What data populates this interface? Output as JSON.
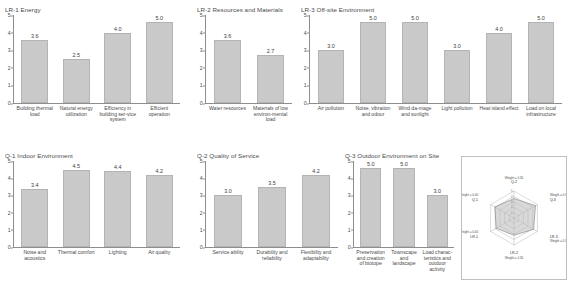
{
  "figure": {
    "panels": [
      {
        "id": "lr1",
        "title": "LR-1 Energy",
        "categories": [
          "Building thermal load",
          "Natural energy utilization",
          "Efficiency in building ser-vice system",
          "Efficient operation"
        ],
        "values": [
          3.6,
          2.5,
          4.0,
          5.0
        ],
        "value_labels": [
          "3.6",
          "2.5",
          "4.0",
          "5.0"
        ],
        "yticks": [
          "0",
          "1",
          "2",
          "3",
          "4",
          "5"
        ],
        "ylim": [
          0,
          5
        ]
      },
      {
        "id": "lr2",
        "title": "LR-2 Resources and Materials",
        "categories": [
          "Water resources",
          "Materials of low environ-mental load"
        ],
        "values": [
          3.6,
          2.7
        ],
        "value_labels": [
          "3.6",
          "2.7"
        ],
        "yticks": [
          "0",
          "1",
          "2",
          "3",
          "4",
          "5"
        ],
        "ylim": [
          0,
          5
        ]
      },
      {
        "id": "lr3",
        "title": "LR-3 Off-site Environment",
        "categories": [
          "Air pollution",
          "Noise, vibration and odour",
          "Wind da-mage and sunlight",
          "Light pollution",
          "Heat island effect",
          "Load on local infrastructure"
        ],
        "values": [
          3.0,
          5.0,
          5.0,
          3.0,
          4.0,
          5.0
        ],
        "value_labels": [
          "3.0",
          "5.0",
          "5.0",
          "3.0",
          "4.0",
          "5.0"
        ],
        "yticks": [
          "0",
          "1",
          "2",
          "3",
          "4",
          "5"
        ],
        "ylim": [
          0,
          5
        ]
      },
      {
        "id": "q1",
        "title": "Q-1 Indoor Environment",
        "categories": [
          "Noise and acoustics",
          "Thermal comfort",
          "Lighting",
          "Air quality"
        ],
        "values": [
          3.4,
          4.5,
          4.4,
          4.2
        ],
        "value_labels": [
          "3.4",
          "4.5",
          "4.4",
          "4.2"
        ],
        "yticks": [
          "0",
          "1",
          "2",
          "3",
          "4",
          "5"
        ],
        "ylim": [
          0,
          5
        ]
      },
      {
        "id": "q2",
        "title": "Q-2 Quality of Service",
        "categories": [
          "Service ability",
          "Durability and reliability",
          "Flexibility and adaptability"
        ],
        "values": [
          3.0,
          3.5,
          4.2
        ],
        "value_labels": [
          "3.0",
          "3.5",
          "4.2"
        ],
        "yticks": [
          "0",
          "1",
          "2",
          "3",
          "4",
          "5"
        ],
        "ylim": [
          0,
          5
        ]
      },
      {
        "id": "q3",
        "title": "Q-3 Outdoor Environment on Site",
        "categories": [
          "Preservation and creation of biotope",
          "Townscape and landscape",
          "Load charac-teristics and outdoor activity"
        ],
        "values": [
          5.0,
          5.0,
          3.0
        ],
        "value_labels": [
          "5.0",
          "5.0",
          "3.0"
        ],
        "yticks": [
          "0",
          "1",
          "2",
          "3",
          "4",
          "5"
        ],
        "ylim": [
          0,
          5
        ]
      }
    ],
    "radar": {
      "type": "radar",
      "axes": [
        "Q-2",
        "Q-3",
        "LR-3",
        "LR-2",
        "LR-1",
        "Q-1"
      ],
      "weight_labels": [
        "Weight = 0.30",
        "Weight = 0.30",
        "Weight = 0.30",
        "Weight = 0.30",
        "Weight = 0.40",
        "Weight = 0.40"
      ],
      "values": [
        3.6,
        4.6,
        4.2,
        3.2,
        3.8,
        4.1
      ],
      "rticks": [
        "1",
        "2",
        "3",
        "4",
        "5"
      ],
      "rlim": [
        0,
        5
      ]
    }
  },
  "chart_data": {
    "type": "bar",
    "ylabel": "Score",
    "ylim": [
      0,
      5
    ],
    "panels": [
      {
        "title": "LR-1 Energy",
        "categories": [
          "Building thermal load",
          "Natural energy utilization",
          "Efficiency in building service system",
          "Efficient operation"
        ],
        "values": [
          3.6,
          2.5,
          4.0,
          5.0
        ]
      },
      {
        "title": "LR-2 Resources and Materials",
        "categories": [
          "Water resources",
          "Materials of low environmental load"
        ],
        "values": [
          3.6,
          2.7
        ]
      },
      {
        "title": "LR-3 Off-site Environment",
        "categories": [
          "Air pollution",
          "Noise, vibration and odour",
          "Wind damage and sunlight",
          "Light pollution",
          "Heat island effect",
          "Load on local infrastructure"
        ],
        "values": [
          3.0,
          5.0,
          5.0,
          3.0,
          4.0,
          5.0
        ]
      },
      {
        "title": "Q-1 Indoor Environment",
        "categories": [
          "Noise and acoustics",
          "Thermal comfort",
          "Lighting",
          "Air quality"
        ],
        "values": [
          3.4,
          4.5,
          4.4,
          4.2
        ]
      },
      {
        "title": "Q-2 Quality of Service",
        "categories": [
          "Service ability",
          "Durability and reliability",
          "Flexibility and adaptability"
        ],
        "values": [
          3.0,
          3.5,
          4.2
        ]
      },
      {
        "title": "Q-3 Outdoor Environment on Site",
        "categories": [
          "Preservation and creation of biotope",
          "Townscape and landscape",
          "Load characteristics and outdoor activity"
        ],
        "values": [
          5.0,
          5.0,
          3.0
        ]
      }
    ],
    "radar": {
      "type": "radar",
      "axes": [
        "Q-2",
        "Q-3",
        "LR-3",
        "LR-2",
        "LR-1",
        "Q-1"
      ],
      "values": [
        3.6,
        4.6,
        4.2,
        3.2,
        3.8,
        4.1
      ],
      "rlim": [
        0,
        5
      ]
    },
    "colors": {
      "bar_fill": "#c9c9c9",
      "bar_edge": "#b4b4b4",
      "axis": "#8e8e8e",
      "text": "#4a4a4a"
    }
  }
}
